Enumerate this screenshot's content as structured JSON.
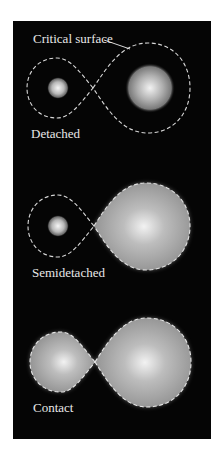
{
  "figure": {
    "annotation": "Critical surface",
    "panels": [
      {
        "label": "Detached"
      },
      {
        "label": "Semidetached"
      },
      {
        "label": "Contact"
      }
    ],
    "colors": {
      "background": "#050505",
      "outline": "#d8d8d8",
      "star_fill": "#a8a8a8",
      "star_highlight": "#f0f0f0",
      "text": "#e8e8e8"
    }
  }
}
